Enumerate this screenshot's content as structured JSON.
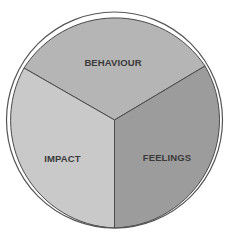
{
  "diagram": {
    "type": "three-segment-circle",
    "outline_color": "#555555",
    "background": "#ffffff",
    "segments": [
      {
        "label": "BEHAVIOUR",
        "position": "top",
        "color": "#b5b5b5"
      },
      {
        "label": "IMPACT",
        "position": "bottom-left",
        "color": "#c9c9c9"
      },
      {
        "label": "FEELINGS",
        "position": "bottom-right",
        "color": "#9c9c9c"
      }
    ]
  }
}
